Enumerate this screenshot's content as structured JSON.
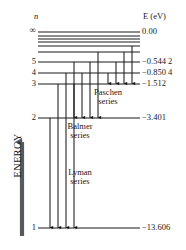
{
  "figure": {
    "type": "energy-level-diagram",
    "axis_header_n": "n",
    "axis_header_e": "E (eV)",
    "energy_axis_label": "ENERGY",
    "infinity_symbol": "∞",
    "line_color": "#1a1a1a"
  },
  "levels": [
    {
      "n": "∞",
      "energy": "0.00",
      "y": 32,
      "x_left": 38,
      "x_right": 140
    },
    {
      "n": "",
      "energy": "",
      "y": 36,
      "x_left": 38,
      "x_right": 140
    },
    {
      "n": "",
      "energy": "",
      "y": 39,
      "x_left": 38,
      "x_right": 140
    },
    {
      "n": "",
      "energy": "",
      "y": 42,
      "x_left": 38,
      "x_right": 140
    },
    {
      "n": "",
      "energy": "",
      "y": 46,
      "x_left": 38,
      "x_right": 140
    },
    {
      "n": "",
      "energy": "",
      "y": 52,
      "x_left": 38,
      "x_right": 140
    },
    {
      "n": "5",
      "energy": "−0.544 2",
      "y": 62,
      "x_left": 38,
      "x_right": 140
    },
    {
      "n": "4",
      "energy": "−0.850 4",
      "y": 73,
      "x_left": 38,
      "x_right": 140
    },
    {
      "n": "3",
      "energy": "−1.512",
      "y": 84,
      "x_left": 38,
      "x_right": 140
    },
    {
      "n": "2",
      "energy": "−3.401",
      "y": 118,
      "x_left": 38,
      "x_right": 140
    },
    {
      "n": "1",
      "energy": "−13.606",
      "y": 228,
      "x_left": 38,
      "x_right": 140
    }
  ],
  "series": [
    {
      "name_line1": "Paschen",
      "name_line2": "series",
      "label_x": 108,
      "label_y": 88,
      "lands_on": 3
    },
    {
      "name_line1": "Balmer",
      "name_line2": "series",
      "label_x": 80,
      "label_y": 122,
      "lands_on": 2
    },
    {
      "name_line1": "Lyman",
      "name_line2": "series",
      "label_x": 80,
      "label_y": 168,
      "lands_on": 1
    }
  ],
  "transitions": {
    "paschen": {
      "to_y": 84,
      "x": [
        108,
        116,
        124,
        132
      ],
      "from_y": [
        73,
        62,
        52,
        46
      ]
    },
    "balmer": {
      "to_y": 118,
      "x": [
        74,
        82,
        90,
        98
      ],
      "from_y": [
        84,
        73,
        62,
        52
      ]
    },
    "lyman": {
      "to_y": 228,
      "x": [
        50,
        58,
        66,
        74
      ],
      "from_y": [
        118,
        84,
        73,
        62
      ]
    }
  },
  "labels": {
    "n_header_x": 34,
    "n_header_y": 12,
    "e_header_x": 143,
    "e_header_y": 12
  }
}
